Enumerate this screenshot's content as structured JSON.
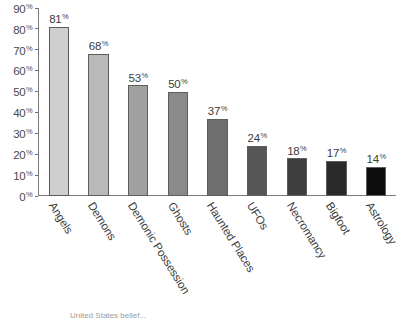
{
  "chart_data": {
    "type": "bar",
    "title": "",
    "subtitle": "",
    "xlabel": "",
    "ylabel": "",
    "categories": [
      "Angels",
      "Demons",
      "Demonic Possession",
      "Ghosts",
      "Haunted Places",
      "UFOs",
      "Necromancy",
      "Bigfoot",
      "Astrology"
    ],
    "values": [
      81,
      68,
      53,
      50,
      37,
      24,
      18,
      17,
      14
    ],
    "value_labels": [
      "81%",
      "68%",
      "53%",
      "50%",
      "37%",
      "24%",
      "18%",
      "17%",
      "14%"
    ],
    "value_suffix": "%",
    "ylim": [
      0,
      90
    ],
    "ytick_values": [
      0,
      10,
      20,
      30,
      40,
      50,
      60,
      70,
      80,
      90
    ],
    "ytick_labels": [
      "0%",
      "10%",
      "20%",
      "30%",
      "40%",
      "50%",
      "60%",
      "70%",
      "80%",
      "90%"
    ],
    "grid": false,
    "legend": false,
    "legend_position": "none",
    "bar_colors": [
      "#cfcfcf",
      "#b9b9b9",
      "#a0a0a0",
      "#8a8a8a",
      "#6e6e6e",
      "#565656",
      "#3e3e3e",
      "#2a2a2a",
      "#0d0d0d"
    ],
    "bar_border_color": "#5d5d5d",
    "axis_color": "#7a7a7a",
    "text_color": "#3c3c3c",
    "background": "#ffffff"
  },
  "caption": "United States belief..."
}
